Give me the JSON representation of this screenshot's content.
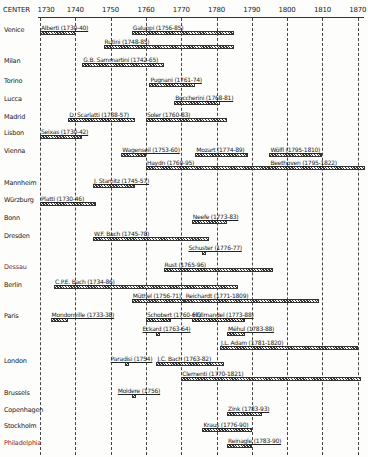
{
  "chart_data": {
    "type": "timeline",
    "title": "",
    "xlabel": "",
    "ylabel": "CENTER",
    "header_label": "CENTER",
    "xlim": [
      1730,
      1820
    ],
    "ticks": [
      {
        "label": "1730",
        "value": 1730
      },
      {
        "label": "1740",
        "value": 1740
      },
      {
        "label": "1750",
        "value": 1750
      },
      {
        "label": "1760",
        "value": 1760
      },
      {
        "label": "1770",
        "value": 1770
      },
      {
        "label": "1780",
        "value": 1780
      },
      {
        "label": "1790",
        "value": 1790
      },
      {
        "label": "1800",
        "value": 1800
      },
      {
        "label": "1810",
        "value": 1810
      },
      {
        "label": "1870",
        "value": 1820
      }
    ],
    "grid": true,
    "cities": [
      {
        "name": "Venice",
        "y": 30
      },
      {
        "name": "Milan",
        "y": 61
      },
      {
        "name": "Torino",
        "y": 81
      },
      {
        "name": "Lucca",
        "y": 99
      },
      {
        "name": "Madrid",
        "y": 117
      },
      {
        "name": "Lisbon",
        "y": 133
      },
      {
        "name": "Vienna",
        "y": 151
      },
      {
        "name": "Mannheim",
        "y": 183
      },
      {
        "name": "Würzburg",
        "y": 200
      },
      {
        "name": "Bonn",
        "y": 218
      },
      {
        "name": "Dresden",
        "y": 236
      },
      {
        "name": "Dessau",
        "y": 267,
        "color": "#8a2a2a"
      },
      {
        "name": "Berlin",
        "y": 285
      },
      {
        "name": "Paris",
        "y": 316
      },
      {
        "name": "London",
        "y": 361
      },
      {
        "name": "Brussels",
        "y": 393
      },
      {
        "name": "Copenhagen",
        "y": 410
      },
      {
        "name": "Stockholm",
        "y": 426
      },
      {
        "name": "Philadelphia",
        "y": 443,
        "color": "#8a2a2a"
      }
    ],
    "composers": [
      {
        "label": "Alberti (1730-40)",
        "city": "Venice",
        "start": 1730,
        "end": 1740,
        "y": 31
      },
      {
        "label": "Galuppi (1756-85)",
        "city": "Venice",
        "start": 1756,
        "end": 1785,
        "y": 31
      },
      {
        "label": "Rutini (1748-85)",
        "city": "Venice",
        "start": 1748,
        "end": 1785,
        "y": 45
      },
      {
        "label": "G.B. Sammartini (1742-65)",
        "city": "Milan",
        "start": 1742,
        "end": 1765,
        "y": 63
      },
      {
        "label": "Pugnani (1761-74)",
        "city": "Torino",
        "start": 1761,
        "end": 1774,
        "y": 83
      },
      {
        "label": "Boccherini (1768-81)",
        "city": "Lucca",
        "start": 1768,
        "end": 1781,
        "y": 101
      },
      {
        "label": "D. Scarlatti (1738-57)",
        "city": "Madrid",
        "start": 1738,
        "end": 1757,
        "y": 118
      },
      {
        "label": "Soler (1760-83)",
        "city": "Madrid",
        "start": 1760,
        "end": 1783,
        "y": 118
      },
      {
        "label": "Seixas (1730-42)",
        "city": "Lisbon",
        "start": 1730,
        "end": 1742,
        "y": 135
      },
      {
        "label": "Wagenseil (1753-60)",
        "city": "Vienna",
        "start": 1753,
        "end": 1760,
        "y": 153
      },
      {
        "label": "Mozart (1774-89)",
        "city": "Vienna",
        "start": 1774,
        "end": 1789,
        "y": 153
      },
      {
        "label": "Wölfl (1795-1810)",
        "city": "Vienna",
        "start": 1795,
        "end": 1810,
        "y": 153
      },
      {
        "label": "Haydn (1760-95)",
        "city": "Vienna",
        "start": 1760,
        "end": 1795,
        "y": 166
      },
      {
        "label": "Beethoven (1795-1822)",
        "city": "Vienna",
        "start": 1795,
        "end": 1822,
        "y": 166
      },
      {
        "label": "J. Stamitz (1745-57)",
        "city": "Mannheim",
        "start": 1745,
        "end": 1757,
        "y": 184
      },
      {
        "label": "Platti (1730-46)",
        "city": "Würzburg",
        "start": 1730,
        "end": 1746,
        "y": 202
      },
      {
        "label": "Neefe (1773-83)",
        "city": "Bonn",
        "start": 1773,
        "end": 1783,
        "y": 220
      },
      {
        "label": "W.F. Bach (1745-78)",
        "city": "Dresden",
        "start": 1745,
        "end": 1778,
        "y": 237
      },
      {
        "label": "Schuster (1776-77)",
        "city": "Dresden",
        "start": 1776,
        "end": 1777,
        "y": 251
      },
      {
        "label": "Rust (1765-96)",
        "city": "Dessau",
        "start": 1765,
        "end": 1796,
        "y": 268
      },
      {
        "label": "C.P.E. Bach (1734-86)",
        "city": "Berlin",
        "start": 1734,
        "end": 1786,
        "y": 285
      },
      {
        "label": "Müthel (1756-71)",
        "city": "Berlin",
        "start": 1756,
        "end": 1771,
        "y": 299
      },
      {
        "label": "Reichardt (1771-1809)",
        "city": "Berlin",
        "start": 1771,
        "end": 1809,
        "y": 299
      },
      {
        "label": "Mondonville (1733-38)",
        "city": "Paris",
        "start": 1733,
        "end": 1738,
        "y": 318
      },
      {
        "label": "Schobert (1760-67)",
        "city": "Paris",
        "start": 1760,
        "end": 1767,
        "y": 318
      },
      {
        "label": "Hüllmandel (1773-88)",
        "city": "Paris",
        "start": 1773,
        "end": 1788,
        "y": 318
      },
      {
        "label": "Eckard (1763-64)",
        "city": "Paris",
        "start": 1763,
        "end": 1764,
        "y": 332
      },
      {
        "label": "Méhul (1783-88)",
        "city": "Paris",
        "start": 1783,
        "end": 1788,
        "y": 332
      },
      {
        "label": "J.L. Adam (1781-1820)",
        "city": "Paris",
        "start": 1781,
        "end": 1820,
        "y": 346
      },
      {
        "label": "Paradisi (1754)",
        "city": "London",
        "start": 1754,
        "end": 1754.5,
        "y": 362
      },
      {
        "label": "J.C. Bach (1763-82)",
        "city": "London",
        "start": 1763,
        "end": 1782,
        "y": 362
      },
      {
        "label": "Clementi (1770-1821)",
        "city": "London",
        "start": 1770,
        "end": 1821,
        "y": 377
      },
      {
        "label": "Moldere (1756)",
        "city": "Brussels",
        "start": 1756,
        "end": 1756.5,
        "y": 394
      },
      {
        "label": "Zink (1783-93)",
        "city": "Copenhagen",
        "start": 1783,
        "end": 1793,
        "y": 412
      },
      {
        "label": "Kraus (1776-90)",
        "city": "Stockholm",
        "start": 1776,
        "end": 1790,
        "y": 428
      },
      {
        "label": "Reinagle (1783-90)",
        "city": "Philadelphia",
        "start": 1783,
        "end": 1790,
        "y": 444
      }
    ]
  }
}
